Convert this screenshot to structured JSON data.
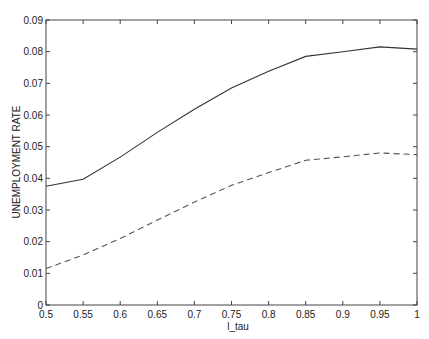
{
  "chart_data": {
    "type": "line",
    "title": "",
    "xlabel": "l_tau",
    "ylabel": "UNEMPLOYMENT RATE",
    "xlim": [
      0.5,
      1.0
    ],
    "ylim": [
      0,
      0.09
    ],
    "grid": false,
    "legend": null,
    "x_ticks": [
      "0.5",
      "0.55",
      "0.6",
      "0.65",
      "0.7",
      "0.75",
      "0.8",
      "0.85",
      "0.9",
      "0.95",
      "1"
    ],
    "y_ticks": [
      "0",
      "0.01",
      "0.02",
      "0.03",
      "0.04",
      "0.05",
      "0.06",
      "0.07",
      "0.08",
      "0.09"
    ],
    "x": [
      0.5,
      0.55,
      0.6,
      0.65,
      0.7,
      0.75,
      0.8,
      0.85,
      0.9,
      0.95,
      1.0
    ],
    "series": [
      {
        "name": "solid",
        "style": "solid",
        "color": "#333333",
        "values": [
          0.0375,
          0.0397,
          0.0467,
          0.0545,
          0.0618,
          0.0685,
          0.0738,
          0.0785,
          0.08,
          0.0815,
          0.0808
        ]
      },
      {
        "name": "dashed",
        "style": "dashed",
        "color": "#555555",
        "values": [
          0.0115,
          0.0158,
          0.021,
          0.0268,
          0.0325,
          0.0378,
          0.0418,
          0.0457,
          0.0468,
          0.048,
          0.0475
        ]
      }
    ]
  }
}
